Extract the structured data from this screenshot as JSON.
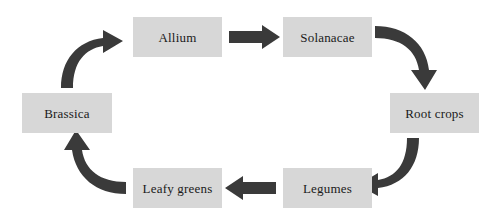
{
  "diagram": {
    "type": "cycle",
    "background_color": "#ffffff",
    "node_fill_color": "#d7d7d7",
    "arrow_color": "#3a3a3a",
    "text_color": "#1a1a1a",
    "direction": "clockwise",
    "nodes": [
      {
        "id": "allium",
        "label": "Allium",
        "position": "top-left-center"
      },
      {
        "id": "solanacae",
        "label": "Solanacae",
        "position": "top-right-center"
      },
      {
        "id": "root_crops",
        "label": "Root crops",
        "position": "right"
      },
      {
        "id": "legumes",
        "label": "Legumes",
        "position": "bottom-right-center"
      },
      {
        "id": "leafy_greens",
        "label": "Leafy greens",
        "position": "bottom-left-center"
      },
      {
        "id": "brassica",
        "label": "Brassica",
        "position": "left"
      }
    ],
    "edges": [
      {
        "id": "allium-to-solanacae",
        "from": "allium",
        "to": "solanacae",
        "style": "straight",
        "direction": "right"
      },
      {
        "id": "solanacae-to-root-crops",
        "from": "solanacae",
        "to": "root_crops",
        "style": "curved",
        "direction": "down"
      },
      {
        "id": "root-crops-to-legumes",
        "from": "root_crops",
        "to": "legumes",
        "style": "curved",
        "direction": "left"
      },
      {
        "id": "legumes-to-leafy-greens",
        "from": "legumes",
        "to": "leafy_greens",
        "style": "straight",
        "direction": "left"
      },
      {
        "id": "leafy-greens-to-brassica",
        "from": "leafy_greens",
        "to": "brassica",
        "style": "curved",
        "direction": "up"
      },
      {
        "id": "brassica-to-allium",
        "from": "brassica",
        "to": "allium",
        "style": "curved",
        "direction": "right"
      }
    ]
  }
}
